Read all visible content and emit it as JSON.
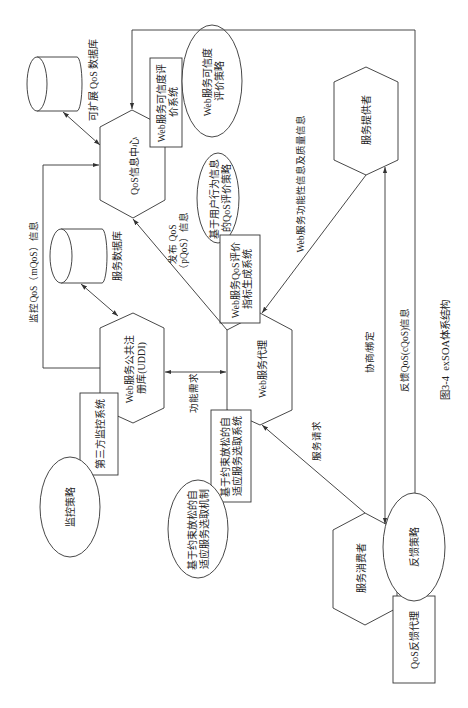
{
  "figure": {
    "caption": "图3-4  exSOA体系结构",
    "colors": {
      "line": "#333333",
      "background": "#ffffff",
      "text": "#222222"
    }
  },
  "nodes": {
    "extensible_qos_db": {
      "shape": "cylinder",
      "label": "可扩展 QoS 数据库"
    },
    "qos_info_center": {
      "shape": "hexagon",
      "label": "QoS信息中心"
    },
    "trust_eval_system": {
      "shape": "rectangle",
      "lines": [
        "Web服务可信度评",
        "价系统"
      ]
    },
    "trust_eval_strategy": {
      "shape": "ellipse",
      "lines": [
        "Web服务可信度",
        "评价策略"
      ]
    },
    "service_provider": {
      "shape": "hexagon",
      "label": "服务提供者"
    },
    "user_behavior_strategy": {
      "shape": "ellipse",
      "lines": [
        "基于用户行为信息",
        "的QoS评价策略"
      ]
    },
    "qos_index_system": {
      "shape": "rectangle",
      "lines": [
        "Web服务QoS评价",
        "指标生成系统"
      ]
    },
    "service_db": {
      "shape": "cylinder",
      "label": "服务数据库"
    },
    "uddi_registry": {
      "shape": "hexagon",
      "lines": [
        "Web服务公共注",
        "册库(UDDI)"
      ]
    },
    "web_service_agent": {
      "shape": "hexagon",
      "label": "Web服务代理"
    },
    "third_party_monitor": {
      "shape": "rectangle",
      "label": "第三方监控系统"
    },
    "monitor_strategy": {
      "shape": "ellipse",
      "label": "监控策略"
    },
    "adaptive_selection_system": {
      "shape": "rectangle",
      "lines": [
        "基于约束放松的自",
        "适应服务选取系统"
      ]
    },
    "adaptive_selection_mechanism": {
      "shape": "ellipse",
      "lines": [
        "基于约束放松的自",
        "适应服务选取机制"
      ]
    },
    "service_consumer": {
      "shape": "hexagon",
      "label": "服务消费者"
    },
    "feedback_strategy": {
      "shape": "ellipse",
      "label": "反馈策略"
    },
    "qos_feedback_agent": {
      "shape": "rectangle",
      "label": "QoS反馈代理"
    }
  },
  "edges": {
    "monitor_qos": {
      "label": "监控QoS（mQoS）信息"
    },
    "publish_qos": {
      "lines": [
        "发布 QoS",
        "（pQoS）信息"
      ]
    },
    "functional_quality_info": {
      "label": "Web服务功能性信息及质量信息"
    },
    "functional_requirement": {
      "label": "功能需求"
    },
    "service_request": {
      "label": "服务请求"
    },
    "negotiate_bind": {
      "label": "协商/绑定"
    },
    "feedback_cqos": {
      "label": "反馈QoS(cQoS)信息"
    }
  }
}
